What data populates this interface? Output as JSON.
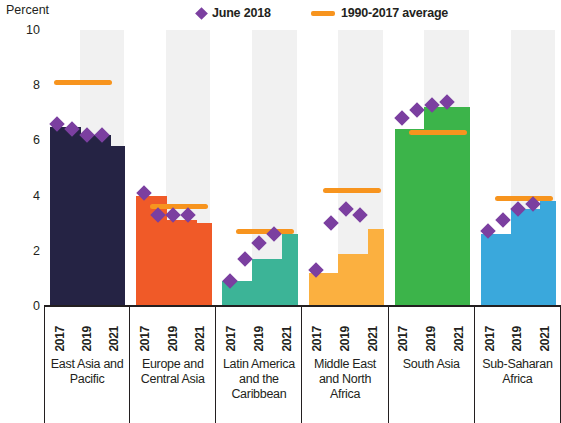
{
  "chart_data": {
    "type": "bar",
    "title": "",
    "subtitle": "",
    "xlabel": "",
    "ylabel": "Percent",
    "ylim": [
      0,
      10
    ],
    "yticks": [
      0,
      2,
      4,
      6,
      8,
      10
    ],
    "grid": false,
    "legend_position": "top",
    "legend": [
      {
        "label": "June 2018",
        "marker": "diamond",
        "color": "#7b3fa0"
      },
      {
        "label": "1990-2017 average",
        "marker": "line",
        "color": "#f7941e"
      }
    ],
    "categories": [
      "2017",
      "2019",
      "2021"
    ],
    "year_ticks": [
      "2017",
      "2019",
      "2021"
    ],
    "all_years": [
      "2017",
      "2018",
      "2019",
      "2020",
      "2021"
    ],
    "groups": [
      {
        "name": "East Asia and Pacific",
        "color": "#252344",
        "values": [
          6.5,
          6.5,
          6.2,
          6.2,
          5.8
        ],
        "june2018": [
          6.6,
          6.4,
          6.2,
          6.2,
          null
        ],
        "average": 8.1
      },
      {
        "name": "Europe and Central Asia",
        "color": "#f05a28",
        "values": [
          4.0,
          4.0,
          3.1,
          3.1,
          3.0
        ],
        "june2018": [
          4.1,
          3.3,
          3.3,
          3.3,
          null
        ],
        "average": 3.6
      },
      {
        "name": "Latin America and the Caribbean",
        "color": "#3cb497",
        "values": [
          0.9,
          0.9,
          1.7,
          1.7,
          2.6
        ],
        "june2018": [
          0.9,
          1.7,
          2.3,
          2.6,
          null
        ],
        "average": 2.7
      },
      {
        "name": "Middle East and North Africa",
        "color": "#fbb040",
        "values": [
          1.2,
          1.2,
          1.9,
          1.9,
          2.8
        ],
        "june2018": [
          1.3,
          3.0,
          3.5,
          3.3,
          null
        ],
        "average": 4.2
      },
      {
        "name": "South Asia",
        "color": "#3cb44a",
        "values": [
          6.4,
          6.4,
          7.2,
          7.2,
          7.2
        ],
        "june2018": [
          6.8,
          7.1,
          7.3,
          7.4,
          null
        ],
        "average": 6.3
      },
      {
        "name": "Sub-Saharan Africa",
        "color": "#3aa8dc",
        "values": [
          2.6,
          2.6,
          3.5,
          3.5,
          3.8
        ],
        "june2018": [
          2.7,
          3.1,
          3.5,
          3.7,
          null
        ],
        "average": 3.9
      }
    ]
  },
  "axis": {
    "y_title": "Percent",
    "tick_10": "10",
    "tick_8": "8",
    "tick_6": "6",
    "tick_4": "4",
    "tick_2": "2",
    "tick_0": "0"
  },
  "legend": {
    "june_label": "June 2018",
    "avg_label": "1990-2017 average"
  },
  "regions": {
    "r0": "East Asia and Pacific",
    "r1": "Europe and Central Asia",
    "r2": "Latin America and the Caribbean",
    "r3": "Middle East and North Africa",
    "r4": "South Asia",
    "r5": "Sub-Saharan Africa"
  }
}
